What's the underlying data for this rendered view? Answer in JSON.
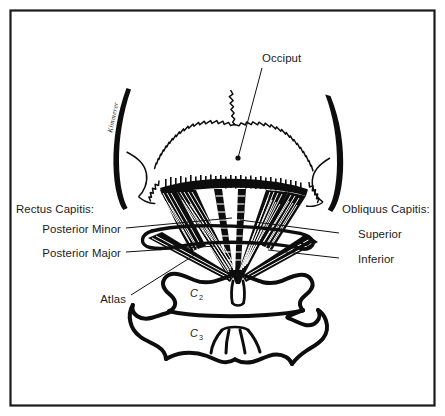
{
  "figure": {
    "background_color": "#ffffff",
    "ink_color": "#0d0d0d",
    "border_color": "#1a1a1a",
    "width": 445,
    "height": 416
  },
  "labels": {
    "occiput": "Occiput",
    "rectus_heading": "Rectus Capitis:",
    "rectus_items": [
      "Posterior Minor",
      "Posterior Major"
    ],
    "obliquus_heading": "Obliquus Capitis:",
    "obliquus_items": [
      "Superior",
      "Inferior"
    ],
    "atlas": "Atlas",
    "vertebra_c2": "C",
    "vertebra_c2_sub": "2",
    "vertebra_c3": "C",
    "vertebra_c3_sub": "3"
  },
  "signature": {
    "text": "Kimmerer"
  },
  "anatomy": {
    "structures": [
      "Occiput",
      "Mastoid process (left)",
      "Mastoid process (right)",
      "Atlas (C1)",
      "Axis (C2)",
      "Third cervical vertebra (C3)",
      "Rectus Capitis Posterior Minor",
      "Rectus Capitis Posterior Major",
      "Obliquus Capitis Superior",
      "Obliquus Capitis Inferior"
    ]
  }
}
